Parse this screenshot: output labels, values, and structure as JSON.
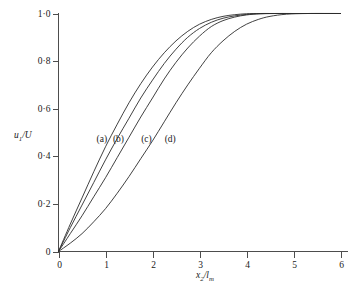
{
  "chart_data": {
    "type": "line",
    "title": "",
    "xlabel": "x2/lm",
    "xlabel_parts": {
      "var": "x",
      "sub": "2",
      "slash": "/",
      "denom": "l",
      "denom_sub": "m"
    },
    "ylabel": "u1/U",
    "ylabel_parts": {
      "var": "u",
      "sub": "1",
      "slash": "/",
      "denom": "U"
    },
    "xlim": [
      0,
      6
    ],
    "ylim": [
      0,
      1.0
    ],
    "grid": false,
    "legend_position": "inline-annotations",
    "xticks": [
      0,
      1,
      2,
      3,
      4,
      5,
      6
    ],
    "xtick_labels": [
      "0",
      "1",
      "2",
      "3",
      "4",
      "5",
      "6"
    ],
    "yticks": [
      0,
      0.2,
      0.4,
      0.6,
      0.8,
      1.0
    ],
    "ytick_labels": [
      "0",
      "0·2",
      "0·4",
      "0·6",
      "0·8",
      "1·0"
    ],
    "annotations": [
      {
        "text": "(a)",
        "x": 1.0,
        "y": 0.47
      },
      {
        "text": "(b)",
        "x": 1.35,
        "y": 0.47
      },
      {
        "text": "(c)",
        "x": 1.95,
        "y": 0.47
      },
      {
        "text": "(d)",
        "x": 2.45,
        "y": 0.47
      }
    ],
    "series": [
      {
        "name": "(a)",
        "x": [
          0,
          0.25,
          0.5,
          0.75,
          1.0,
          1.25,
          1.5,
          1.75,
          2.0,
          2.25,
          2.5,
          2.75,
          3.0,
          3.25,
          3.5,
          3.75,
          4.0,
          4.3,
          4.7,
          5.2,
          5.8,
          6.0
        ],
        "y": [
          0,
          0.115,
          0.225,
          0.335,
          0.44,
          0.535,
          0.625,
          0.705,
          0.775,
          0.835,
          0.885,
          0.925,
          0.955,
          0.975,
          0.988,
          0.995,
          0.999,
          1.0,
          1.0,
          1.0,
          1.0,
          1.0
        ]
      },
      {
        "name": "(b)",
        "x": [
          0,
          0.25,
          0.5,
          0.75,
          1.0,
          1.25,
          1.5,
          1.75,
          2.0,
          2.25,
          2.5,
          2.75,
          3.0,
          3.25,
          3.5,
          3.75,
          4.0,
          4.25,
          4.6,
          5.0,
          5.5,
          6.0
        ],
        "y": [
          0,
          0.1,
          0.195,
          0.29,
          0.385,
          0.475,
          0.56,
          0.645,
          0.72,
          0.79,
          0.85,
          0.9,
          0.937,
          0.963,
          0.98,
          0.99,
          0.996,
          0.999,
          1.0,
          1.0,
          1.0,
          1.0
        ]
      },
      {
        "name": "(c)",
        "x": [
          0,
          0.25,
          0.5,
          0.75,
          1.0,
          1.25,
          1.5,
          1.75,
          2.0,
          2.25,
          2.5,
          2.75,
          3.0,
          3.25,
          3.5,
          3.75,
          4.0,
          4.3,
          4.7,
          5.0,
          5.5,
          6.0
        ],
        "y": [
          0,
          0.075,
          0.15,
          0.23,
          0.31,
          0.395,
          0.48,
          0.565,
          0.645,
          0.725,
          0.795,
          0.855,
          0.905,
          0.945,
          0.97,
          0.985,
          0.994,
          0.999,
          1.0,
          1.0,
          1.0,
          1.0
        ]
      },
      {
        "name": "(d)",
        "x": [
          0,
          0.25,
          0.5,
          0.75,
          1.0,
          1.25,
          1.5,
          1.75,
          2.0,
          2.25,
          2.5,
          2.75,
          3.0,
          3.25,
          3.5,
          3.75,
          4.0,
          4.25,
          4.5,
          4.85,
          5.3,
          6.0
        ],
        "y": [
          0,
          0.035,
          0.075,
          0.125,
          0.18,
          0.245,
          0.315,
          0.39,
          0.465,
          0.545,
          0.625,
          0.7,
          0.77,
          0.835,
          0.885,
          0.925,
          0.955,
          0.975,
          0.988,
          0.997,
          1.0,
          1.0
        ]
      }
    ]
  }
}
